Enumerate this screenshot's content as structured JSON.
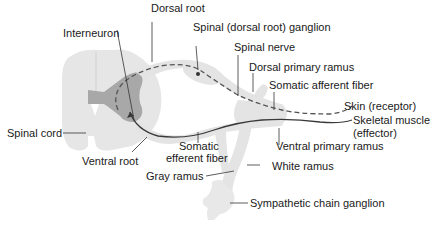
{
  "diagram": {
    "colors": {
      "cord_white_matter": "#e6e6e6",
      "cord_gray_matter": "#a8a8a8",
      "nerve_fill": "#e4e4e4",
      "afferent_fiber": "#555555",
      "efferent_fiber": "#3a3a3a",
      "leader_line": "#333333"
    },
    "labels": {
      "dorsal_root": "Dorsal root",
      "spinal_ganglion": "Spinal (dorsal root) ganglion",
      "interneuron": "Interneuron",
      "spinal_nerve": "Spinal nerve",
      "dorsal_primary_ramus": "Dorsal primary ramus",
      "somatic_afferent_fiber": "Somatic afferent fiber",
      "skin_receptor": "Skin (receptor)",
      "skeletal_muscle_line1": "Skeletal muscle",
      "skeletal_muscle_line2": "(effector)",
      "spinal_cord": "Spinal cord",
      "somatic_efferent_line1": "Somatic",
      "somatic_efferent_line2": "efferent fiber",
      "ventral_primary_ramus": "Ventral primary ramus",
      "ventral_root": "Ventral root",
      "white_ramus": "White ramus",
      "gray_ramus": "Gray ramus",
      "sympathetic_chain_ganglion": "Sympathetic chain ganglion"
    }
  }
}
